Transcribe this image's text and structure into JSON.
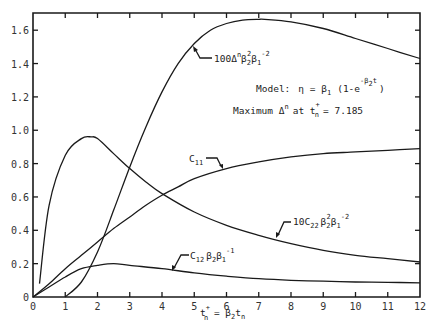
{
  "chart_data": {
    "type": "line",
    "title": "",
    "xlabel": "t_n^+ = β2 t_n",
    "ylabel": "",
    "xlim": [
      0,
      12
    ],
    "ylim": [
      0,
      1.7
    ],
    "grid": false,
    "legend": "inline curve labels with arrows",
    "x_ticks": [
      0,
      1,
      2,
      3,
      4,
      5,
      6,
      7,
      8,
      9,
      10,
      11,
      12
    ],
    "y_ticks": [
      0,
      0.2,
      0.4,
      0.6,
      0.8,
      1.0,
      1.2,
      1.4,
      1.6
    ],
    "x_tick_labels": [
      "0",
      "1",
      "2",
      "3",
      "4",
      "5",
      "6",
      "7",
      "8",
      "9",
      "10",
      "11",
      "12"
    ],
    "y_tick_labels": [
      "0",
      "0.2",
      "0.4",
      "0.6",
      "0.8",
      "1.0",
      "1.2",
      "1.4",
      "1.6"
    ],
    "series": [
      {
        "name": "100Δ^n β2^2 β1^-2",
        "label_parts": {
          "base": "100Δ",
          "sup1": "n",
          "mid": "β",
          "sub2": "2",
          "sup2": "2",
          "mid2": "β",
          "sub3": "1",
          "sup3": "-2"
        },
        "x": [
          1.0,
          1.5,
          2.0,
          2.5,
          3.0,
          3.5,
          4.0,
          4.5,
          5.0,
          5.5,
          6.0,
          6.5,
          7.0,
          7.185,
          8.0,
          9.0,
          10.0,
          11.0,
          12.0
        ],
        "values": [
          0.0,
          0.09,
          0.27,
          0.52,
          0.78,
          1.02,
          1.23,
          1.4,
          1.52,
          1.6,
          1.64,
          1.66,
          1.665,
          1.665,
          1.65,
          1.61,
          1.55,
          1.49,
          1.43
        ]
      },
      {
        "name": "C11",
        "label_parts": {
          "base": "C",
          "sub": "11"
        },
        "x": [
          0.0,
          0.5,
          1.0,
          1.5,
          2.0,
          2.5,
          3.0,
          3.5,
          4.0,
          4.5,
          5.0,
          6.0,
          7.0,
          8.0,
          9.0,
          10.0,
          11.0,
          12.0
        ],
        "values": [
          0.0,
          0.08,
          0.17,
          0.25,
          0.33,
          0.41,
          0.48,
          0.55,
          0.61,
          0.66,
          0.71,
          0.77,
          0.81,
          0.84,
          0.86,
          0.87,
          0.88,
          0.89
        ]
      },
      {
        "name": "10C22 β2^2 β1^-2",
        "label_parts": {
          "base": "10C",
          "sub1": "22",
          "mid": "β",
          "sub2": "2",
          "sup2": "2",
          "mid2": "β",
          "sub3": "1",
          "sup3": "-2"
        },
        "x": [
          0.2,
          0.5,
          1.0,
          1.5,
          1.8,
          2.0,
          2.5,
          3.0,
          3.5,
          4.0,
          5.0,
          6.0,
          7.0,
          8.0,
          9.0,
          10.0,
          11.0,
          12.0
        ],
        "values": [
          0.08,
          0.55,
          0.85,
          0.95,
          0.96,
          0.95,
          0.86,
          0.77,
          0.69,
          0.62,
          0.51,
          0.43,
          0.37,
          0.32,
          0.28,
          0.25,
          0.23,
          0.21
        ]
      },
      {
        "name": "C12 β2 β1^-1",
        "label_parts": {
          "base": "C",
          "sub1": "12",
          "mid": "β",
          "sub2": "2",
          "mid2": "β",
          "sub3": "1",
          "sup3": "-1"
        },
        "x": [
          0.0,
          0.5,
          1.0,
          1.5,
          2.0,
          2.5,
          3.0,
          4.0,
          5.0,
          6.0,
          7.0,
          8.0,
          9.0,
          10.0,
          11.0,
          12.0
        ],
        "values": [
          0.0,
          0.06,
          0.12,
          0.17,
          0.19,
          0.2,
          0.19,
          0.17,
          0.145,
          0.125,
          0.11,
          0.1,
          0.095,
          0.09,
          0.088,
          0.085
        ]
      }
    ],
    "annotations": [
      "Model: η = β1 (1-e^(-β2 t))",
      "Maximum Δ^n at t_n^+ = 7.185"
    ]
  },
  "axes": {
    "x_label_main": "t",
    "x_label_sup": "+",
    "x_label_sub": "n",
    "x_label_eq": " = ",
    "x_label_beta": "β",
    "x_label_beta_sub": "2",
    "x_label_t": "t",
    "x_label_t_sub": "n"
  },
  "annotations": {
    "model_prefix": "Model:",
    "model_eta": "η = β",
    "model_eta_sub": "1",
    "model_paren": "(1-e",
    "model_exp": "-β",
    "model_exp_sub": "2",
    "model_exp_t": "t",
    "model_close": ")",
    "max_prefix": "Maximum Δ",
    "max_sup": "n",
    "max_at": "at t",
    "max_t_sup": "+",
    "max_t_sub": "n",
    "max_value": "= 7.185"
  },
  "labels": {
    "delta": {
      "base": "100Δ",
      "sup1": "n",
      "beta_a": "β",
      "sub_a": "2",
      "sup_a": "2",
      "beta_b": "β",
      "sub_b": "1",
      "sup_b": "-2"
    },
    "c11": {
      "base": "C",
      "sub": "11"
    },
    "c22": {
      "base": "10C",
      "sub": "22",
      "beta_a": "β",
      "sub_a": "2",
      "sup_a": "2",
      "beta_b": "β",
      "sub_b": "1",
      "sup_b": "-2"
    },
    "c12": {
      "base": "C",
      "sub": "12",
      "beta_a": "β",
      "sub_a": "2",
      "beta_b": "β",
      "sub_b": "1",
      "sup_b": "-1"
    }
  }
}
